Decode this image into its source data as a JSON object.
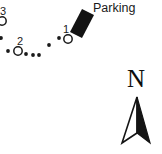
{
  "figure": {
    "type": "map-fragment",
    "width": 162,
    "height": 154,
    "background_color": "#ffffff",
    "ink_color": "#1a1a1a"
  },
  "labels": {
    "parking": "Parking",
    "north": "N",
    "station_1": "1",
    "station_2": "2",
    "station_3": "3"
  },
  "stations": [
    {
      "id": "station-1",
      "label": "1",
      "cx": 68,
      "cy": 39,
      "r": 4.2
    },
    {
      "id": "station-2",
      "label": "2",
      "cx": 18,
      "cy": 51,
      "r": 4.2
    },
    {
      "id": "station-3",
      "label": "3",
      "cx": 2,
      "cy": 21,
      "r": 4.2
    }
  ],
  "trail_dots": [
    {
      "cx": 1,
      "cy": 38,
      "r": 1.9
    },
    {
      "cx": 8,
      "cy": 51,
      "r": 1.9
    },
    {
      "cx": 26,
      "cy": 54,
      "r": 1.9
    },
    {
      "cx": 33,
      "cy": 55,
      "r": 1.9
    },
    {
      "cx": 39,
      "cy": 55,
      "r": 1.9
    },
    {
      "cx": 49,
      "cy": 45,
      "r": 1.9
    },
    {
      "cx": 59,
      "cy": 38,
      "r": 1.9
    }
  ],
  "parking_building": {
    "name": "parking-building",
    "fill": "#131313",
    "points": "82,9 94,15 82,38 70,32"
  },
  "north_arrow": {
    "name": "north-arrow",
    "fill_dark": "#141414",
    "stroke": "#141414",
    "left_blade": "137,97 122,143 137,133",
    "right_blade": "137,97 150,143 137,133"
  }
}
